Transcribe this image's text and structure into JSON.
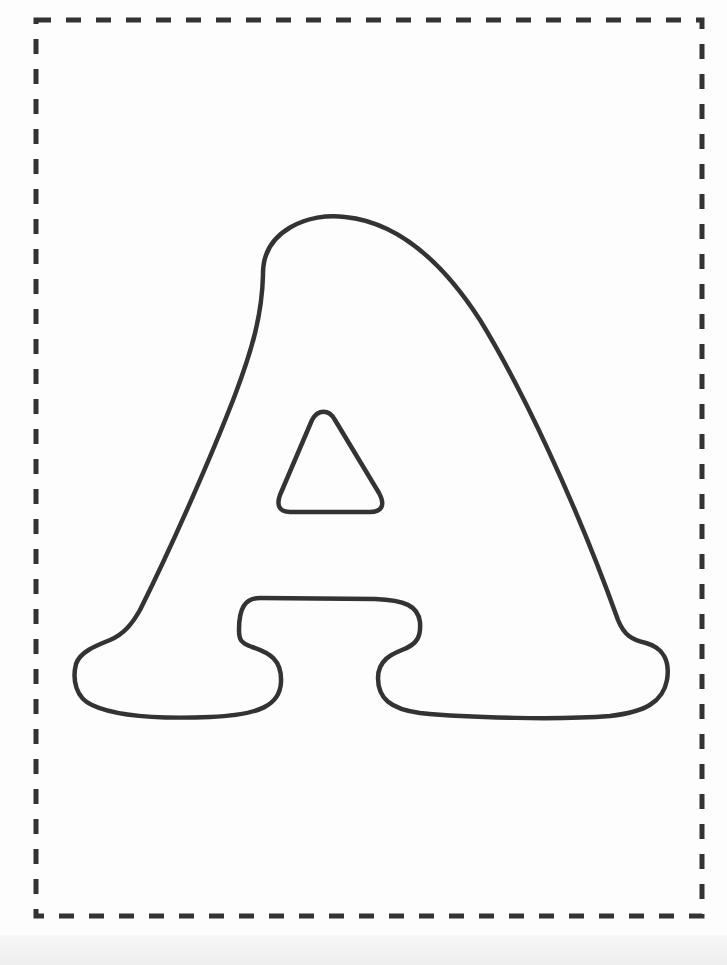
{
  "page": {
    "type": "printable letter coloring page",
    "letter": "A",
    "style": "bubble letter outline",
    "background_color": "#fdfdfd",
    "outline_color": "#333333",
    "border": {
      "style": "dashed",
      "color": "#333333",
      "rect": {
        "x": 36,
        "y": 20,
        "width": 666,
        "height": 896
      }
    }
  }
}
